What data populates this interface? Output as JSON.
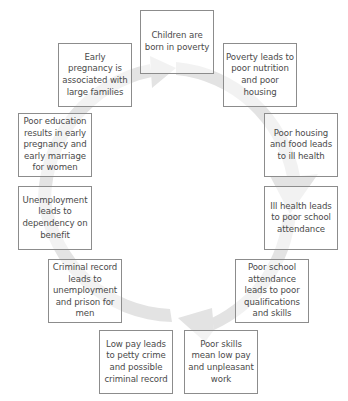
{
  "diagram": {
    "type": "cycle",
    "direction": "clockwise",
    "colors": {
      "arrow": "#e3e3e3",
      "box_border": "#8c8c8c",
      "text": "#4a4a4a"
    },
    "steps": [
      {
        "id": "children",
        "label": "Children are born in poverty",
        "x": 140,
        "y": 10
      },
      {
        "id": "poverty",
        "label": "Poverty leads to poor nutrition and poor housing",
        "x": 223,
        "y": 43
      },
      {
        "id": "housing",
        "label": "Poor housing and food leads to ill health",
        "x": 264,
        "y": 113
      },
      {
        "id": "ill-health",
        "label": "Ill health leads to poor school attendance",
        "x": 264,
        "y": 186
      },
      {
        "id": "school",
        "label": "Poor school attendance leads to poor qualifications and skills",
        "x": 235,
        "y": 259
      },
      {
        "id": "skills",
        "label": "Poor skills mean low pay and unpleasant work",
        "x": 184,
        "y": 330
      },
      {
        "id": "low-pay",
        "label": "Low pay leads to petty crime and possible criminal record",
        "x": 99,
        "y": 330
      },
      {
        "id": "criminal",
        "label": "Criminal record leads to unemployment and prison for men",
        "x": 48,
        "y": 259
      },
      {
        "id": "unemployment",
        "label": "Unemployment leads to dependency on benefit",
        "x": 18,
        "y": 186
      },
      {
        "id": "education",
        "label": "Poor education results in early pregnancy and early marriage for women",
        "x": 18,
        "y": 113
      },
      {
        "id": "pregnancy",
        "label": "Early pregnancy is associated with large families",
        "x": 58,
        "y": 43
      }
    ]
  }
}
